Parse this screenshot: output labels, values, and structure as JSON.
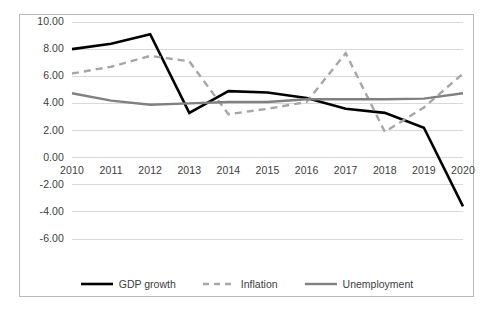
{
  "chart_data": {
    "type": "line",
    "title": "",
    "subtitle": "",
    "xlabel": "",
    "ylabel": "",
    "x": [
      "2010",
      "2011",
      "2012",
      "2013",
      "2014",
      "2015",
      "2016",
      "2017",
      "2018",
      "2019",
      "2020"
    ],
    "categories": [
      "2010",
      "2011",
      "2012",
      "2013",
      "2014",
      "2015",
      "2016",
      "2017",
      "2018",
      "2019",
      "2020"
    ],
    "xlim": [
      "2010",
      "2020"
    ],
    "ylim": [
      -6.0,
      10.0
    ],
    "ytick_labels": [
      "10.00",
      "8.00",
      "6.00",
      "4.00",
      "2.00",
      "0.00",
      "-2.00",
      "-4.00",
      "-6.00"
    ],
    "ytick_values": [
      10.0,
      8.0,
      6.0,
      4.0,
      2.0,
      0.0,
      -2.0,
      -4.0,
      -6.0
    ],
    "grid": true,
    "grid_axis": "y",
    "grid_color": "#d9d9d9",
    "legend_position": "bottom",
    "series": [
      {
        "name": "GDP growth",
        "style": "solid",
        "color": "#000000",
        "width": 2.6,
        "values": [
          8.0,
          8.4,
          9.1,
          3.3,
          4.9,
          4.8,
          4.4,
          3.6,
          3.3,
          2.2,
          -3.6
        ]
      },
      {
        "name": "Inflation",
        "style": "dashed",
        "color": "#a6a6a6",
        "width": 2.4,
        "values": [
          6.2,
          6.7,
          7.5,
          7.1,
          3.2,
          3.6,
          4.1,
          7.7,
          1.9,
          3.7,
          6.2
        ]
      },
      {
        "name": "Unemployment",
        "style": "solid",
        "color": "#808080",
        "width": 2.4,
        "values": [
          4.75,
          4.2,
          3.9,
          4.0,
          4.1,
          4.1,
          4.3,
          4.3,
          4.3,
          4.35,
          4.75
        ]
      }
    ]
  },
  "legend": {
    "items": [
      {
        "label": "GDP growth",
        "icon": "line-solid-black-icon"
      },
      {
        "label": "Inflation",
        "icon": "line-dashed-gray-icon"
      },
      {
        "label": "Unemployment",
        "icon": "line-solid-gray-icon"
      }
    ]
  }
}
